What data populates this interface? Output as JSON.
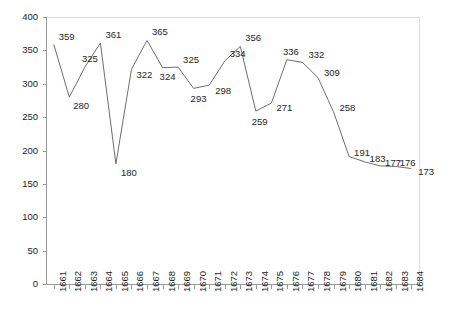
{
  "chart_data": {
    "type": "line",
    "title": "",
    "subtitle": "",
    "xlabel": "",
    "ylabel": "",
    "categories": [
      "1661",
      "1662",
      "1663",
      "1664",
      "1665",
      "1666",
      "1667",
      "1668",
      "1669",
      "1670",
      "1671",
      "1672",
      "1673",
      "1674",
      "1675",
      "1676",
      "1677",
      "1678",
      "1679",
      "1680",
      "1681",
      "1682",
      "1683",
      "1684"
    ],
    "values": [
      359,
      280,
      325,
      361,
      180,
      322,
      365,
      324,
      325,
      293,
      298,
      334,
      356,
      259,
      271,
      336,
      332,
      309,
      258,
      191,
      183,
      177,
      176,
      173
    ],
    "series": [
      {
        "name": "",
        "values": [
          359,
          280,
          325,
          361,
          180,
          322,
          365,
          324,
          325,
          293,
          298,
          334,
          356,
          259,
          271,
          336,
          332,
          309,
          258,
          191,
          183,
          177,
          176,
          173
        ]
      }
    ],
    "point_labels": [
      "359",
      "280",
      "325",
      "361",
      "180",
      "322",
      "365",
      "324",
      "325",
      "293",
      "298",
      "334",
      "356",
      "259",
      "271",
      "336",
      "332",
      "309",
      "258",
      "191",
      "183",
      "177",
      "176",
      "173"
    ],
    "ylim": [
      0,
      400
    ],
    "ytick_labels": [
      "0",
      "50",
      "100",
      "150",
      "200",
      "250",
      "300",
      "350",
      "400"
    ],
    "ytick_values": [
      0,
      50,
      100,
      150,
      200,
      250,
      300,
      350,
      400
    ],
    "grid": false,
    "legend": null,
    "legend_position": "none",
    "line_color": "#6e6e6e",
    "axis_color": "#9a9a9a",
    "frame_color": "#dcdcdc",
    "label_color": "#1d1d1d",
    "background": "#ffffff"
  }
}
